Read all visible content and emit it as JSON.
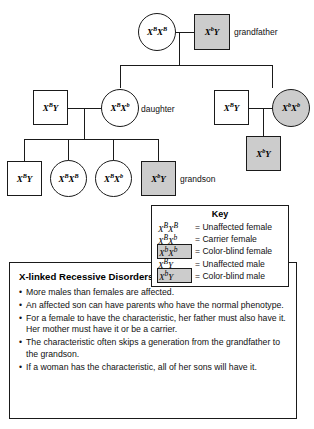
{
  "diagram": {
    "title_hidden": "X-linked recessive pedigree",
    "individuals": [
      {
        "id": "grandmother",
        "shape": "circle",
        "status": "unaffected",
        "allele1": "X",
        "sup1": "B",
        "allele2": "X",
        "sup2": "B",
        "genotype_text": "XBXB",
        "label": ""
      },
      {
        "id": "grandfather",
        "shape": "square",
        "status": "affected",
        "allele1": "X",
        "sup1": "b",
        "allele2": "Y",
        "sup2": "",
        "genotype_text": "XbY",
        "label": "grandfather"
      },
      {
        "id": "son-in-law-left",
        "shape": "square",
        "status": "unaffected",
        "allele1": "X",
        "sup1": "B",
        "allele2": "Y",
        "sup2": "",
        "genotype_text": "XBY",
        "label": ""
      },
      {
        "id": "daughter-left",
        "shape": "circle",
        "status": "carrier",
        "allele1": "X",
        "sup1": "B",
        "allele2": "X",
        "sup2": "b",
        "genotype_text": "XBXb",
        "label": "daughter"
      },
      {
        "id": "son-in-law-right",
        "shape": "square",
        "status": "unaffected",
        "allele1": "X",
        "sup1": "B",
        "allele2": "Y",
        "sup2": "",
        "genotype_text": "XBY",
        "label": ""
      },
      {
        "id": "daughter-right",
        "shape": "circle",
        "status": "affected",
        "allele1": "X",
        "sup1": "b",
        "allele2": "X",
        "sup2": "b",
        "genotype_text": "XbXb",
        "label": ""
      },
      {
        "id": "grandson-right",
        "shape": "square",
        "status": "affected",
        "allele1": "X",
        "sup1": "b",
        "allele2": "Y",
        "sup2": "",
        "genotype_text": "XbY",
        "label": ""
      },
      {
        "id": "child-1",
        "shape": "square",
        "status": "unaffected",
        "allele1": "X",
        "sup1": "B",
        "allele2": "Y",
        "sup2": "",
        "genotype_text": "XBY",
        "label": ""
      },
      {
        "id": "child-2",
        "shape": "circle",
        "status": "unaffected",
        "allele1": "X",
        "sup1": "B",
        "allele2": "X",
        "sup2": "B",
        "genotype_text": "XBXB",
        "label": ""
      },
      {
        "id": "child-3",
        "shape": "circle",
        "status": "carrier",
        "allele1": "X",
        "sup1": "B",
        "allele2": "X",
        "sup2": "b",
        "genotype_text": "XBXb",
        "label": ""
      },
      {
        "id": "child-4",
        "shape": "square",
        "status": "affected",
        "allele1": "X",
        "sup1": "b",
        "allele2": "Y",
        "sup2": "",
        "genotype_text": "XbY",
        "label": "grandson"
      }
    ],
    "labels": {
      "grandfather": "grandfather",
      "daughter": "daughter",
      "grandson": "grandson"
    }
  },
  "key": {
    "title": "Key",
    "entries": [
      {
        "allele1": "X",
        "sup1": "B",
        "allele2": "X",
        "sup2": "B",
        "boxed": false,
        "description": "= Unaffected female"
      },
      {
        "allele1": "X",
        "sup1": "B",
        "allele2": "X",
        "sup2": "b",
        "boxed": false,
        "description": "= Carrier female"
      },
      {
        "allele1": "X",
        "sup1": "b",
        "allele2": "X",
        "sup2": "b",
        "boxed": true,
        "description": "= Color-blind female"
      },
      {
        "allele1": "X",
        "sup1": "B",
        "allele2": "Y",
        "sup2": "",
        "boxed": false,
        "description": "= Unaffected male"
      },
      {
        "allele1": "X",
        "sup1": "b",
        "allele2": "Y",
        "sup2": "",
        "boxed": true,
        "description": "= Color-blind male"
      }
    ]
  },
  "info": {
    "title": "X-linked Recessive Disorders",
    "bullets": [
      "More males than females are affected.",
      "An affected son can have parents who have the normal phenotype.",
      "For a female to have the characteristic, her father must also have it. Her mother must have it or be a carrier.",
      "The characteristic often skips a generation from the grandfather to the grandson.",
      "If a woman has the characteristic, all of her sons will have it."
    ]
  },
  "colors": {
    "affected_fill": "#cccccc",
    "unaffected_fill": "#ffffff",
    "line": "#1a1a1a",
    "text": "#111111"
  }
}
